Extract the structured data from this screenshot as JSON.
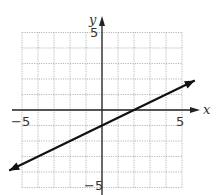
{
  "chart_data": {
    "type": "line",
    "title": "",
    "xlabel": "x",
    "ylabel": "y",
    "xlim": [
      -6,
      6
    ],
    "ylim": [
      -6,
      6
    ],
    "grid": true,
    "grid_style": "dotted",
    "tick_labels": {
      "x": [
        "-5",
        "5"
      ],
      "y": [
        "5",
        "-5"
      ]
    },
    "series": [
      {
        "name": "line",
        "equation": "y = 0.5x - 1",
        "slope": 0.5,
        "intercept": -1,
        "x": [
          -6,
          -5,
          0,
          2,
          5,
          6
        ],
        "y": [
          -4,
          -3.5,
          -1,
          0,
          1.5,
          2
        ],
        "arrows": "both"
      }
    ]
  },
  "labels": {
    "x_axis": "x",
    "y_axis": "y",
    "x_min": "−5",
    "x_max": "5",
    "y_max": "5",
    "y_min": "−5"
  },
  "colors": {
    "grid": "#9a9a9a",
    "axis": "#222222",
    "line": "#111111"
  }
}
